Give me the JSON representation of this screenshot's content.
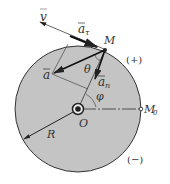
{
  "diagram": {
    "colors": {
      "disk_fill": "#c4c4c4",
      "stroke": "#333333",
      "background": "#ffffff"
    },
    "labels": {
      "velocity": "v",
      "tangential_accel": "a",
      "tangential_sub": "τ",
      "normal_accel": "a",
      "normal_sub": "n",
      "total_accel": "a",
      "point": "M",
      "start_point": "M",
      "start_sub": "0",
      "center": "O",
      "radius": "R",
      "angle_theta": "θ",
      "angle_phi": "φ",
      "positive_dir": "(+)",
      "negative_dir": "(−)"
    }
  }
}
